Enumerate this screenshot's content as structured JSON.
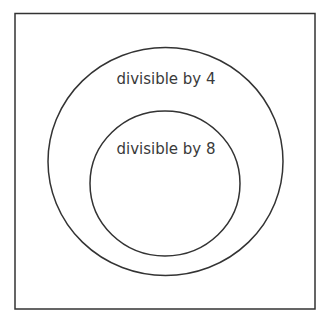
{
  "diagram": {
    "type": "venn",
    "universe": {
      "label": ""
    },
    "sets": [
      {
        "id": "outer",
        "label": "divisible by 4"
      },
      {
        "id": "inner",
        "label": "divisible by 8",
        "subset_of": "outer"
      }
    ],
    "colors": {
      "stroke": "#333333",
      "text": "#3a3a3a",
      "background": "#ffffff"
    }
  }
}
